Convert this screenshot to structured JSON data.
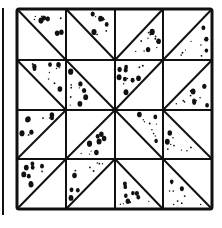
{
  "figure": {
    "colors": {
      "ink": "#111111",
      "paper": "#ffffff"
    },
    "grid": {
      "x": [
        17,
        66,
        115,
        163,
        212
      ],
      "y": [
        9,
        60,
        110,
        159,
        209
      ]
    },
    "edge_line": {
      "x": 3,
      "y1": 8,
      "y2": 215
    },
    "cells": [
      [
        {
          "diag": "tlbr",
          "shade": "tr"
        },
        {
          "diag": "tlbr",
          "shade": "tr"
        },
        {
          "diag": "bltr",
          "shade": "br"
        },
        {
          "diag": "bltr",
          "shade": "br"
        }
      ],
      [
        {
          "diag": "tlbr",
          "shade": "tr"
        },
        {
          "diag": "tlbr",
          "shade": "bl"
        },
        {
          "diag": "bltr",
          "shade": "tl"
        },
        {
          "diag": "bltr",
          "shade": "br"
        }
      ],
      [
        {
          "diag": "bltr",
          "shade": "tl"
        },
        {
          "diag": "bltr",
          "shade": "br"
        },
        {
          "diag": "tlbr",
          "shade": "tr"
        },
        {
          "diag": "tlbr",
          "shade": "bl"
        }
      ],
      [
        {
          "diag": "bltr",
          "shade": "tl"
        },
        {
          "diag": "bltr",
          "shade": "tl"
        },
        {
          "diag": "tlbr",
          "shade": "bl"
        },
        {
          "diag": "tlbr",
          "shade": "bl"
        }
      ]
    ]
  }
}
